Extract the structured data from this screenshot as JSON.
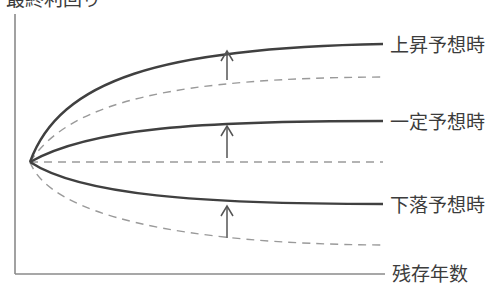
{
  "diagram": {
    "title": "最終利回り",
    "x_axis_label": "残存年数",
    "colors": {
      "axis": "#8a8a8a",
      "solid_curve": "#404040",
      "dashed_curve": "#9a9a9a",
      "arrow": "#555555",
      "text": "#3c3c3c"
    },
    "origin": [
      30,
      162
    ],
    "curves": [
      {
        "name": "上昇予想時",
        "style": "solid",
        "path": "M30,162 C60,80 160,48 383,44",
        "label_pos": [
          390,
          34
        ]
      },
      {
        "name": "上昇_base",
        "style": "dashed",
        "path": "M30,162 C70,100 180,78 383,77"
      },
      {
        "name": "一定予想時",
        "style": "solid",
        "path": "M30,162 C90,128 200,121 383,121",
        "label_pos": [
          390,
          111
        ]
      },
      {
        "name": "一定_base",
        "style": "dashed",
        "path": "M30,162 L383,162"
      },
      {
        "name": "下落予想時",
        "style": "solid",
        "path": "M30,162 C80,195 200,204 383,204",
        "label_pos": [
          390,
          194
        ]
      },
      {
        "name": "下落_base",
        "style": "dashed",
        "path": "M30,162 C50,215 180,244 383,245"
      }
    ],
    "arrows": [
      {
        "x": 227,
        "y_from": 80,
        "y_to": 51
      },
      {
        "x": 227,
        "y_from": 158,
        "y_to": 126
      },
      {
        "x": 227,
        "y_from": 238,
        "y_to": 206
      }
    ],
    "labels": {
      "rise": "上昇予想時",
      "flat": "一定予想時",
      "fall": "下落予想時"
    }
  },
  "chart_data": {
    "type": "line",
    "title": "最終利回り",
    "xlabel": "残存年数",
    "ylabel": "最終利回り",
    "series": [
      {
        "name": "上昇予想時",
        "style": "solid",
        "shape": "rising concave curve (above base)"
      },
      {
        "name": "上昇予想時 (base)",
        "style": "dashed",
        "shape": "rising curve"
      },
      {
        "name": "一定予想時",
        "style": "solid",
        "shape": "gently rising curve (above base)"
      },
      {
        "name": "一定予想時 (base)",
        "style": "dashed",
        "shape": "flat"
      },
      {
        "name": "下落予想時",
        "style": "solid",
        "shape": "declining curve (above base)"
      },
      {
        "name": "下落予想時 (base)",
        "style": "dashed",
        "shape": "declining curve"
      }
    ],
    "annotations": [
      "↑ arrows from each dashed curve to solid curve indicating upward shift"
    ],
    "grid": false
  }
}
